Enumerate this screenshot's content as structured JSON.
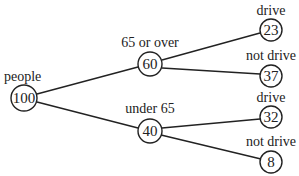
{
  "diagram": {
    "type": "tree",
    "root": {
      "label": "people",
      "value": "100"
    },
    "level1": [
      {
        "label": "65 or over",
        "value": "60"
      },
      {
        "label": "under 65",
        "value": "40"
      }
    ],
    "level2": [
      {
        "parent": "65 or over",
        "label": "drive",
        "value": "23"
      },
      {
        "parent": "65 or over",
        "label": "not drive",
        "value": "37"
      },
      {
        "parent": "under 65",
        "label": "drive",
        "value": "32"
      },
      {
        "parent": "under 65",
        "label": "not drive",
        "value": "8"
      }
    ]
  },
  "colors": {
    "line": "#222222",
    "background": "#ffffff"
  }
}
